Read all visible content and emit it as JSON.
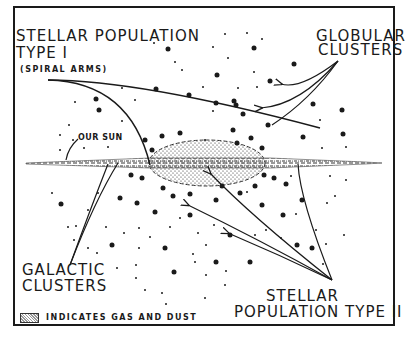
{
  "labels": {
    "pop1_line1": "STELLAR POPULATION",
    "pop1_line2": "TYPE I",
    "spiral_arms": "(SPIRAL ARMS)",
    "globular_line1": "GLOBULAR",
    "globular_line2": "CLUSTERS",
    "our_sun": "OUR SUN",
    "galactic_line1": "GALACTIC",
    "galactic_line2": "CLUSTERS",
    "pop2_line1": "STELLAR",
    "pop2_line2": "POPULATION TYPE II",
    "legend_text": "INDICATES GAS AND DUST"
  },
  "colors": {
    "ink": "#1a1a1a",
    "background": "#ffffff"
  }
}
